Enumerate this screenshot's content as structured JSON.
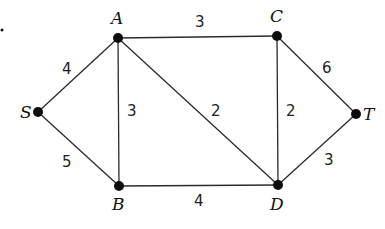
{
  "graph": {
    "type": "weighted-undirected-graph",
    "nodes": [
      {
        "id": "S",
        "label": "S",
        "x": 38,
        "y": 112,
        "lx": 20,
        "ly": 118
      },
      {
        "id": "A",
        "label": "A",
        "x": 118,
        "y": 38,
        "lx": 111,
        "ly": 24
      },
      {
        "id": "B",
        "label": "B",
        "x": 119,
        "y": 186,
        "lx": 112,
        "ly": 210
      },
      {
        "id": "C",
        "label": "C",
        "x": 277,
        "y": 36,
        "lx": 270,
        "ly": 22
      },
      {
        "id": "D",
        "label": "D",
        "x": 278,
        "y": 185,
        "lx": 270,
        "ly": 210
      },
      {
        "id": "T",
        "label": "T",
        "x": 356,
        "y": 114,
        "lx": 363,
        "ly": 120
      }
    ],
    "edges": [
      {
        "from": "S",
        "to": "A",
        "weight": "4",
        "wx": 62,
        "wy": 74
      },
      {
        "from": "S",
        "to": "B",
        "weight": "5",
        "wx": 62,
        "wy": 167
      },
      {
        "from": "A",
        "to": "B",
        "weight": "3",
        "wx": 127,
        "wy": 116
      },
      {
        "from": "A",
        "to": "C",
        "weight": "3",
        "wx": 195,
        "wy": 27
      },
      {
        "from": "A",
        "to": "D",
        "weight": "2",
        "wx": 211,
        "wy": 116
      },
      {
        "from": "C",
        "to": "D",
        "weight": "2",
        "wx": 286,
        "wy": 116
      },
      {
        "from": "B",
        "to": "D",
        "weight": "4",
        "wx": 194,
        "wy": 206
      },
      {
        "from": "C",
        "to": "T",
        "weight": "6",
        "wx": 322,
        "wy": 73
      },
      {
        "from": "D",
        "to": "T",
        "weight": "3",
        "wx": 324,
        "wy": 165
      }
    ],
    "marker_dot": {
      "x": 2,
      "y": 30
    }
  }
}
